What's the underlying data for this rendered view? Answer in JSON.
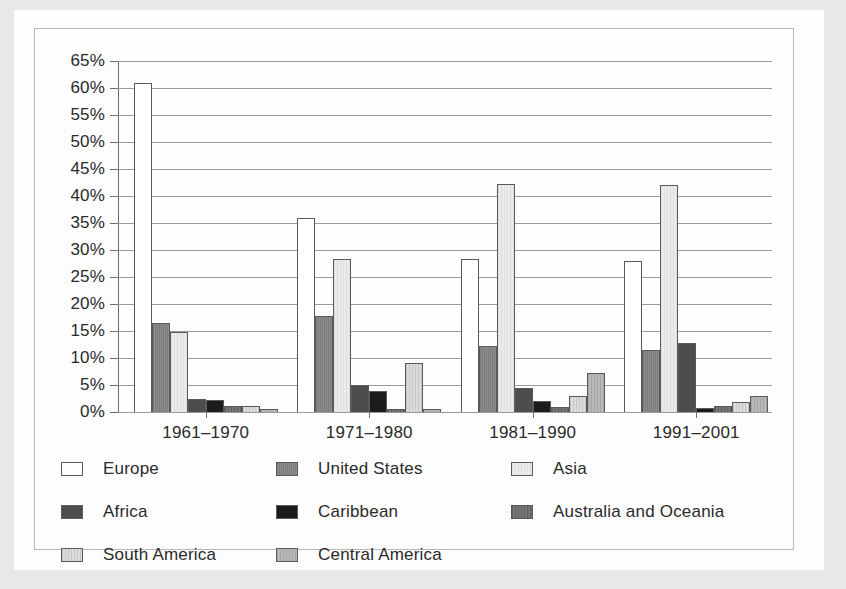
{
  "chart_data": {
    "type": "bar",
    "title": "",
    "xlabel": "",
    "ylabel": "",
    "ylim": [
      0,
      65
    ],
    "ytick_step": 5,
    "grid": true,
    "legend_position": "bottom",
    "categories": [
      "1961–1970",
      "1971–1980",
      "1981–1990",
      "1991–2001"
    ],
    "ytick_labels": [
      "65%",
      "60%",
      "55%",
      "50%",
      "45%",
      "40%",
      "35%",
      "30%",
      "25%",
      "20%",
      "15%",
      "10%",
      "5%",
      "0%"
    ],
    "ytick_values": [
      65,
      60,
      55,
      50,
      45,
      40,
      35,
      30,
      25,
      20,
      15,
      10,
      5,
      0
    ],
    "series": [
      {
        "name": "Europe",
        "key": "europe",
        "color": "#ffffff",
        "values": [
          61.0,
          36.0,
          28.4,
          28.0
        ]
      },
      {
        "name": "United States",
        "key": "us",
        "color": "#838383",
        "values": [
          16.5,
          17.8,
          12.3,
          11.4
        ]
      },
      {
        "name": "Asia",
        "key": "asia",
        "color": "#e3e3e3",
        "values": [
          14.8,
          28.3,
          42.2,
          42.0
        ]
      },
      {
        "name": "Africa",
        "key": "africa",
        "color": "#4d4d4d",
        "values": [
          2.5,
          5.0,
          4.5,
          12.8
        ]
      },
      {
        "name": "Caribbean",
        "key": "carib",
        "color": "#1c1c1c",
        "values": [
          2.2,
          3.8,
          2.0,
          0.8
        ]
      },
      {
        "name": "Australia and Oceania",
        "key": "aus",
        "color": "#6b6b6b",
        "values": [
          1.1,
          0.6,
          0.9,
          1.2
        ]
      },
      {
        "name": "South America",
        "key": "south",
        "color": "#d2d2d2",
        "values": [
          1.1,
          9.0,
          3.0,
          1.8
        ]
      },
      {
        "name": "Central America",
        "key": "central",
        "color": "#afafaf",
        "values": [
          0.5,
          0.6,
          7.2,
          3.0
        ]
      }
    ]
  }
}
